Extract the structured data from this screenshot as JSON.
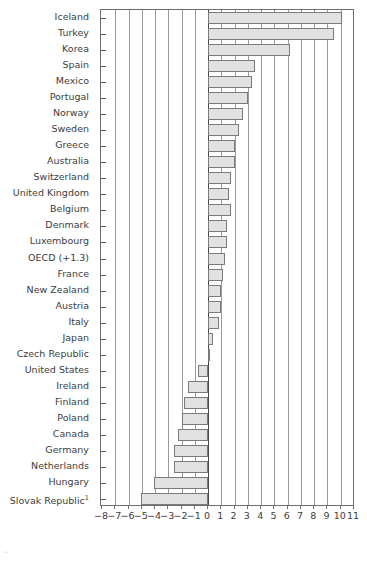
{
  "chart_data": {
    "type": "bar",
    "orientation": "horizontal",
    "title": "",
    "subtitle": "",
    "xlabel": "",
    "ylabel": "",
    "xlim": [
      -8,
      11
    ],
    "xticks": [
      "-8",
      "-7",
      "-6",
      "-5",
      "-4",
      "-3",
      "-2",
      "-1",
      "0",
      "1",
      "2",
      "3",
      "4",
      "5",
      "6",
      "7",
      "8",
      "9",
      "10",
      "11"
    ],
    "xtick_values": [
      -8,
      -7,
      -6,
      -5,
      -4,
      -3,
      -2,
      -1,
      0,
      1,
      2,
      3,
      4,
      5,
      6,
      7,
      8,
      9,
      10,
      11
    ],
    "grid": true,
    "grid_axis": "x",
    "legend": "none",
    "zero_reference": 0,
    "categories": [
      "Iceland",
      "Turkey",
      "Korea",
      "Spain",
      "Mexico",
      "Portugal",
      "Norway",
      "Sweden",
      "Greece",
      "Australia",
      "Switzerland",
      "United Kingdom",
      "Belgium",
      "Denmark",
      "Luxembourg",
      "OECD (+1.3)",
      "France",
      "New Zealand",
      "Austria",
      "Italy",
      "Japan",
      "Czech Republic",
      "United States",
      "Ireland",
      "Finland",
      "Poland",
      "Canada",
      "Germany",
      "Netherlands",
      "Hungary",
      "Slovak Republic"
    ],
    "category_footnotes": {
      "Slovak Republic": "1"
    },
    "values": [
      10.1,
      9.5,
      6.2,
      3.5,
      3.3,
      3.0,
      2.6,
      2.3,
      2.0,
      2.0,
      1.7,
      1.6,
      1.7,
      1.4,
      1.4,
      1.3,
      1.1,
      1.0,
      0.95,
      0.85,
      0.4,
      0.1,
      -0.75,
      -1.5,
      -1.85,
      -2.0,
      -2.25,
      -2.6,
      -2.6,
      -4.05,
      -5.05
    ],
    "series_name": ""
  },
  "axis": {
    "bar_color": "#e2e2e2",
    "bar_edge_color": "#7b7b7b",
    "grid_color": "#9a9a9a",
    "frame_color": "#6e6e6e",
    "text_color": "#3d3d3d"
  },
  "footnote": {
    "marker": "--"
  }
}
